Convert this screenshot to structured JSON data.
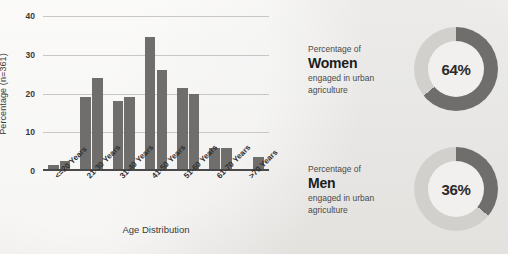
{
  "chart_data": {
    "type": "bar",
    "title": "",
    "xlabel": "Age Distribution",
    "ylabel": "Percentage (n=361)",
    "ylim": [
      0,
      40
    ],
    "yticks": [
      0,
      10,
      20,
      30,
      40
    ],
    "grid": true,
    "legend": "none",
    "categories": [
      "<=20 Years",
      "21-30 Years",
      "31-40 Years",
      "41-50 Years",
      "51-60 Years",
      "61-70 Years",
      ">70 Years"
    ],
    "series": [
      {
        "name": "Series 1",
        "values": [
          1.5,
          19,
          18,
          34.5,
          21.5,
          6,
          0.3
        ]
      },
      {
        "name": "Series 2",
        "values": [
          2.5,
          24,
          19,
          26,
          20,
          6,
          3.5
        ]
      }
    ],
    "bar_color": "#6f6e6c"
  },
  "axes": {
    "y_tick_labels": [
      "0",
      "10",
      "20",
      "30",
      "40"
    ],
    "y_axis_title": "Percentage (n=361)",
    "x_axis_title": "Age Distribution",
    "x_tick_labels": [
      "<=20 Years",
      "21-30 Years",
      "31-40 Years",
      "41-50 Years",
      "51-60 Years",
      "61-70 Years",
      ">70 Years"
    ]
  },
  "stats": [
    {
      "line1": "Percentage of",
      "subject": "Women",
      "line3": "engaged in urban",
      "line4": "agriculture",
      "value": 64,
      "value_label": "64%",
      "arc_color": "#6f6e6c",
      "track_color": "#d2d0cd"
    },
    {
      "line1": "Percentage of",
      "subject": "Men",
      "line3": "engaged in urban",
      "line4": "agriculture",
      "value": 36,
      "value_label": "36%",
      "arc_color": "#6f6e6c",
      "track_color": "#d2d0cd"
    }
  ],
  "colors": {
    "background": "#f2f1ef",
    "bar": "#6f6e6c",
    "grid": "#c9c7c4",
    "axis": "#4a4a4a",
    "text": "#3a3a3a"
  }
}
